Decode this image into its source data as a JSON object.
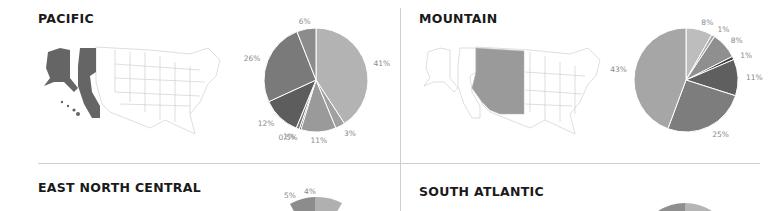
{
  "panels": [
    {
      "title": "PACIFIC"
    },
    {
      "title": "MOUNTAIN"
    },
    {
      "title": "EAST NORTH CENTRAL"
    },
    {
      "title": "SOUTH ATLANTIC"
    }
  ],
  "chart_data": [
    {
      "type": "pie",
      "title": "PACIFIC",
      "slices": [
        {
          "label": "41%",
          "value": 41,
          "color": "#b3b3b3"
        },
        {
          "label": "3%",
          "value": 3,
          "color": "#a0a0a0"
        },
        {
          "label": "11%",
          "value": 11,
          "color": "#9a9a9a"
        },
        {
          "label": "0.5%",
          "value": 0.5,
          "color": "#2e2e2e"
        },
        {
          "label": "1%",
          "value": 1,
          "color": "#777777"
        },
        {
          "label": "12%",
          "value": 12,
          "color": "#5d5d5d"
        },
        {
          "label": "26%",
          "value": 26,
          "color": "#7a7a7a"
        },
        {
          "label": "6%",
          "value": 6,
          "color": "#8c8c8c"
        }
      ]
    },
    {
      "type": "pie",
      "title": "MOUNTAIN",
      "slices": [
        {
          "label": "8%",
          "value": 8,
          "color": "#bdbdbd"
        },
        {
          "label": "1%",
          "value": 1,
          "color": "#a8a8a8"
        },
        {
          "label": "8%",
          "value": 8,
          "color": "#8f8f8f"
        },
        {
          "label": "1%",
          "value": 1,
          "color": "#3f3f3f"
        },
        {
          "label": "11%",
          "value": 11,
          "color": "#5f5f5f"
        },
        {
          "label": "25%",
          "value": 25,
          "color": "#7d7d7d"
        },
        {
          "label": "43%",
          "value": 43,
          "color": "#a6a6a6"
        }
      ]
    },
    {
      "type": "pie",
      "title": "EAST NORTH CENTRAL",
      "partial": true,
      "visible_labels": [
        "5%",
        "4%"
      ]
    },
    {
      "type": "pie",
      "title": "SOUTH ATLANTIC",
      "partial": true,
      "visible_labels": []
    }
  ],
  "maps": [
    {
      "region": "Pacific",
      "highlight_color": "#6a6a6a"
    },
    {
      "region": "Mountain",
      "highlight_color": "#9a9a9a"
    }
  ]
}
